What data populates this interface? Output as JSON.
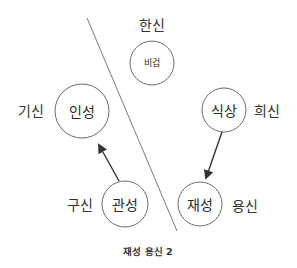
{
  "diagram": {
    "caption": "재성 용신 2",
    "colors": {
      "circle_stroke": "#6a6a6a",
      "divider": "#7a7a7a",
      "arrow": "#333333",
      "text": "#2a2a2a"
    },
    "nodes": [
      {
        "id": "bigeop",
        "label": "비겁",
        "role": "한신",
        "cx": 152,
        "cy": 63,
        "r": 22,
        "small": true
      },
      {
        "id": "inseong",
        "label": "인성",
        "role": "기신",
        "cx": 82,
        "cy": 111,
        "r": 27,
        "small": false
      },
      {
        "id": "siksang",
        "label": "식상",
        "role": "희신",
        "cx": 224,
        "cy": 110,
        "r": 22,
        "small": false
      },
      {
        "id": "gwanseong",
        "label": "관성",
        "role": "구신",
        "cx": 125,
        "cy": 204,
        "r": 23,
        "small": false
      },
      {
        "id": "jaeseong",
        "label": "재성",
        "role": "용신",
        "cx": 200,
        "cy": 204,
        "r": 22,
        "small": false
      }
    ],
    "roles": {
      "bigeop": "한신",
      "inseong": "기신",
      "siksang": "희신",
      "gwanseong": "구신",
      "jaeseong": "용신"
    },
    "edges": [
      {
        "from": "관성",
        "to": "인성"
      },
      {
        "from": "식상",
        "to": "재성"
      }
    ],
    "divider": {
      "x1": 87,
      "y1": 18,
      "x2": 177,
      "y2": 231
    }
  }
}
